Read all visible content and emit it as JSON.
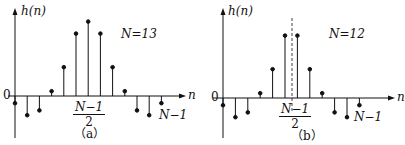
{
  "panels": [
    {
      "id": "a",
      "caption": "（a）",
      "y_label": "h(n)",
      "x_label": "n",
      "origin_label": "0",
      "n_label": "N=13",
      "center_label": {
        "num": "N−1",
        "den": "2"
      },
      "end_label": "N−1",
      "center_dashed_line": false
    },
    {
      "id": "b",
      "caption": "（b）",
      "y_label": "h(n)",
      "x_label": "n",
      "origin_label": "0",
      "n_label": "N=12",
      "center_label": {
        "num": "N−1",
        "den": "2"
      },
      "end_label": "N−1",
      "center_dashed_line": true
    }
  ],
  "chart_data": [
    {
      "type": "stem",
      "title": "(a) N=13, symmetric impulse response (odd length)",
      "xlabel": "n",
      "ylabel": "h(n)",
      "x": [
        0,
        1,
        2,
        3,
        4,
        5,
        6,
        7,
        8,
        9,
        10,
        11,
        12
      ],
      "values": [
        -0.15,
        -0.4,
        -0.3,
        0.1,
        0.6,
        1.3,
        1.55,
        1.3,
        0.6,
        0.1,
        -0.3,
        -0.4,
        -0.15
      ],
      "symmetry_center": "(N-1)/2 = 6"
    },
    {
      "type": "stem",
      "title": "(b) N=12, symmetric impulse response (even length)",
      "xlabel": "n",
      "ylabel": "h(n)",
      "x": [
        0,
        1,
        2,
        3,
        4,
        5,
        6,
        7,
        8,
        9,
        10,
        11
      ],
      "values": [
        -0.15,
        -0.4,
        -0.3,
        0.1,
        0.6,
        1.3,
        1.3,
        0.6,
        0.1,
        -0.3,
        -0.4,
        -0.15
      ],
      "symmetry_center": "(N-1)/2 = 5.5"
    }
  ]
}
